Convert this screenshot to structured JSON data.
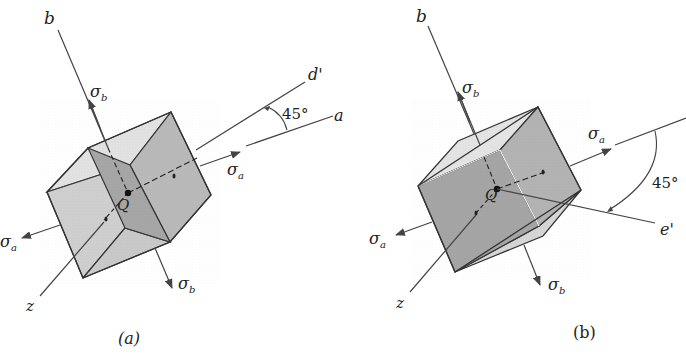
{
  "figure": {
    "panels": [
      {
        "id": "a",
        "caption": "(a)",
        "axis_b": "b",
        "axis_z": "z",
        "axis_a": "a",
        "axis_rotated": "d'",
        "angle": "45°",
        "point": "Q",
        "stress_a_sym": "σ",
        "stress_a_sub": "a",
        "stress_b_sym": "σ",
        "stress_b_sub": "b"
      },
      {
        "id": "b",
        "caption": "(b)",
        "axis_b": "b",
        "axis_z": "z",
        "axis_a": "a",
        "axis_rotated": "e'",
        "angle": "45°",
        "point": "Q",
        "stress_a_sym": "σ",
        "stress_a_sub": "a",
        "stress_b_sym": "σ",
        "stress_b_sub": "b"
      }
    ],
    "colors": {
      "line": "#333333",
      "face_light": "#d6d6d6",
      "face_mid": "#b5b5b5",
      "face_dark": "#999999",
      "face_top": "#e8e8e8"
    }
  }
}
